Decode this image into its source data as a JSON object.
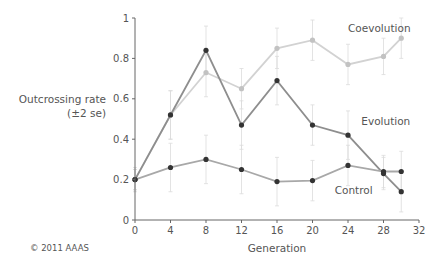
{
  "chart_data": {
    "type": "line",
    "title": "",
    "xlabel": "Generation",
    "ylabel": "Outcrossing rate",
    "ylabel_sub": "(±2 se)",
    "xlim": [
      0,
      32
    ],
    "ylim": [
      0,
      1
    ],
    "xticks": [
      0,
      4,
      8,
      12,
      16,
      20,
      24,
      28,
      32
    ],
    "yticks": [
      0,
      0.2,
      0.4,
      0.6,
      0.8,
      1
    ],
    "ytick_labels": [
      "0",
      "0.2",
      "0.4",
      "0.6",
      "0.8",
      "1"
    ],
    "grid": false,
    "legend": "inline labels",
    "series": [
      {
        "name": "Coevolution",
        "x": [
          0,
          4,
          8,
          12,
          16,
          20,
          24,
          28,
          30
        ],
        "values": [
          0.2,
          0.52,
          0.73,
          0.65,
          0.85,
          0.89,
          0.77,
          0.81,
          0.9
        ],
        "err": [
          0.05,
          0.12,
          0.12,
          0.1,
          0.1,
          0.1,
          0.1,
          0.09,
          0.1
        ],
        "line_color": "#d2d2d2",
        "marker_color": "#c2c2c2",
        "label_pos": [
          24,
          0.93
        ]
      },
      {
        "name": "Evolution",
        "x": [
          0,
          4,
          8,
          12,
          16,
          20,
          24,
          28,
          30
        ],
        "values": [
          0.2,
          0.52,
          0.84,
          0.47,
          0.69,
          0.47,
          0.42,
          0.23,
          0.14
        ],
        "err": [
          0.05,
          0.12,
          0.12,
          0.12,
          0.12,
          0.1,
          0.12,
          0.08,
          0.1
        ],
        "line_color": "#8e8e8e",
        "marker_color": "#333333",
        "label_pos": [
          25.5,
          0.47
        ]
      },
      {
        "name": "Control",
        "x": [
          0,
          4,
          8,
          12,
          16,
          20,
          24,
          28,
          30
        ],
        "values": [
          0.2,
          0.26,
          0.3,
          0.25,
          0.19,
          0.195,
          0.27,
          0.24,
          0.24
        ],
        "err": [
          0.06,
          0.12,
          0.12,
          0.12,
          0.12,
          0.1,
          0.1,
          0.08,
          0.1
        ],
        "line_color": "#a8a8a8",
        "marker_color": "#333333",
        "label_pos": [
          22.5,
          0.13
        ]
      }
    ]
  },
  "copyright": "© 2011 AAAS"
}
